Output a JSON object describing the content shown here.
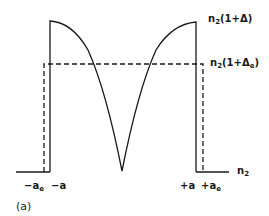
{
  "diagram": {
    "type": "refractive-index-profile",
    "caption": "(a)",
    "labels": {
      "peak_prefix": "n",
      "peak_sub": "2",
      "peak_suffix": "(1+Δ)",
      "eq_prefix": "n",
      "eq_sub": "2",
      "eq_open": "(1+Δ",
      "eq_sub2": "e",
      "eq_close": ")",
      "base_prefix": "n",
      "base_sub": "2",
      "neg_ae_prefix": "−a",
      "neg_ae_sub": "e",
      "neg_a": "−a",
      "pos_a": "+a",
      "pos_ae_prefix": "+a",
      "pos_ae_sub": "e"
    },
    "curves": {
      "actual_profile": "solid W-shaped profile peaking at n2(1+Δ) at ±a, dipping to n2 at center",
      "equivalent_step": "dashed step profile of height n2(1+Δe) between ±ae"
    },
    "colors": {
      "line": "#1a1a1a",
      "background": "#ffffff"
    }
  }
}
